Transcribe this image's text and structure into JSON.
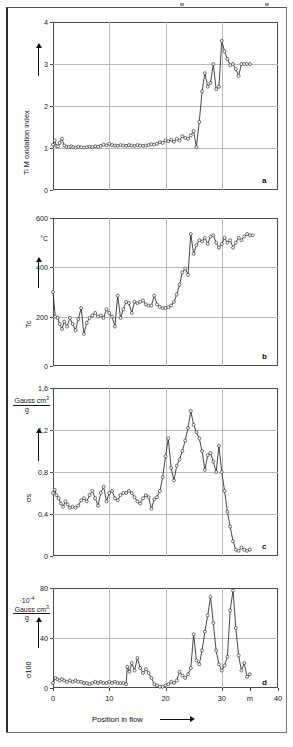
{
  "figure": {
    "panel_letters": [
      "a",
      "b",
      "c",
      "d"
    ],
    "x_axis": {
      "title": "Position in flow",
      "arrow": "⟶",
      "ticks": [
        "0",
        "10",
        "20",
        "30",
        "m",
        "40"
      ],
      "tick_values": [
        0,
        10,
        20,
        30,
        35,
        40
      ],
      "unit": "m",
      "min": 0,
      "max": 40
    }
  },
  "chart_data": [
    {
      "type": "line",
      "panel": "a",
      "title": "",
      "ylabel": "Ti M oxidation index",
      "xlabel": "Position in flow",
      "yunit": "",
      "ylim": [
        0,
        4
      ],
      "xlim": [
        0,
        40
      ],
      "yticks": [
        0,
        1,
        2,
        3,
        4
      ],
      "ytick_labels": [
        "0",
        "1",
        "2",
        "3",
        "4"
      ],
      "grid": true,
      "markers": "open-circle",
      "x": [
        0.0,
        0.3,
        0.6,
        0.9,
        1.2,
        1.6,
        2.0,
        2.4,
        2.8,
        3.2,
        3.6,
        4.0,
        4.5,
        5.0,
        5.5,
        6.0,
        6.5,
        7.0,
        7.5,
        8.0,
        8.5,
        9.0,
        9.5,
        10.0,
        10.5,
        11.0,
        11.5,
        12.0,
        12.5,
        13.0,
        13.5,
        14.0,
        14.5,
        15.0,
        15.5,
        16.0,
        16.5,
        17.0,
        17.5,
        18.0,
        18.5,
        19.0,
        19.5,
        20.0,
        20.5,
        21.0,
        21.5,
        22.0,
        22.5,
        23.0,
        23.5,
        24.0,
        24.5,
        25.0,
        25.5,
        26.0,
        26.5,
        27.0,
        27.5,
        28.0,
        28.5,
        29.0,
        29.5,
        30.0,
        30.5,
        31.0,
        31.5,
        32.0,
        32.5,
        33.0,
        33.5,
        34.0,
        34.5,
        35.0
      ],
      "values": [
        1.08,
        1.18,
        1.05,
        1.04,
        1.12,
        1.22,
        1.06,
        1.03,
        1.02,
        1.04,
        1.02,
        1.01,
        1.03,
        1.02,
        1.01,
        1.02,
        1.03,
        1.02,
        1.04,
        1.03,
        1.05,
        1.08,
        1.06,
        1.1,
        1.07,
        1.06,
        1.05,
        1.07,
        1.06,
        1.05,
        1.07,
        1.06,
        1.05,
        1.07,
        1.06,
        1.05,
        1.06,
        1.07,
        1.09,
        1.08,
        1.1,
        1.14,
        1.12,
        1.18,
        1.16,
        1.2,
        1.15,
        1.22,
        1.18,
        1.28,
        1.24,
        1.22,
        1.3,
        1.4,
        1.02,
        1.62,
        2.35,
        2.78,
        2.46,
        2.55,
        3.0,
        2.4,
        2.46,
        3.55,
        3.3,
        3.12,
        2.97,
        3.0,
        2.88,
        2.72,
        3.0,
        3.0,
        3.0,
        3.0
      ]
    },
    {
      "type": "line",
      "panel": "b",
      "title": "",
      "ylabel": "Tc",
      "xlabel": "Position in flow",
      "yunit": "°C",
      "ylim": [
        0,
        600
      ],
      "xlim": [
        0,
        40
      ],
      "yticks": [
        0,
        200,
        400,
        600
      ],
      "ytick_labels": [
        "0",
        "200",
        "400",
        "600"
      ],
      "grid": true,
      "markers": "open-circle",
      "x": [
        0.0,
        0.4,
        0.8,
        1.2,
        1.6,
        2.0,
        2.5,
        3.0,
        3.5,
        4.0,
        4.5,
        5.0,
        5.5,
        6.0,
        6.5,
        7.0,
        7.5,
        8.0,
        8.5,
        9.0,
        9.5,
        10.0,
        10.5,
        11.0,
        11.5,
        12.0,
        12.5,
        13.0,
        13.5,
        14.0,
        14.5,
        15.0,
        15.5,
        16.0,
        16.5,
        17.0,
        17.5,
        18.0,
        18.5,
        19.0,
        19.5,
        20.0,
        20.5,
        21.0,
        21.5,
        22.0,
        22.5,
        23.0,
        23.5,
        24.0,
        24.5,
        25.0,
        25.5,
        26.0,
        26.5,
        27.0,
        27.5,
        28.0,
        28.5,
        29.0,
        29.5,
        30.0,
        30.5,
        31.0,
        31.5,
        32.0,
        32.5,
        33.0,
        33.5,
        34.0,
        34.5,
        35.0,
        35.5
      ],
      "values": [
        300,
        200,
        195,
        170,
        150,
        180,
        160,
        195,
        170,
        145,
        190,
        235,
        130,
        175,
        195,
        205,
        215,
        200,
        205,
        195,
        230,
        215,
        200,
        160,
        285,
        195,
        230,
        260,
        255,
        215,
        260,
        255,
        260,
        265,
        250,
        245,
        245,
        285,
        250,
        240,
        235,
        235,
        238,
        245,
        260,
        290,
        330,
        380,
        395,
        370,
        535,
        455,
        490,
        510,
        505,
        520,
        495,
        525,
        530,
        500,
        480,
        495,
        520,
        500,
        510,
        480,
        500,
        520,
        510,
        525,
        535,
        530,
        530
      ]
    },
    {
      "type": "line",
      "panel": "c",
      "title": "",
      "ylabel": "σs",
      "xlabel": "Position in flow",
      "yunit": "Gauss cm3 / g",
      "yunit_numerator": "Gauss cm",
      "yunit_exponent": "3",
      "yunit_denominator": "g",
      "ylim": [
        0,
        1.6
      ],
      "xlim": [
        0,
        40
      ],
      "yticks": [
        0,
        0.4,
        0.8,
        1.2,
        1.6
      ],
      "ytick_labels": [
        "0",
        "0,4",
        "0,8",
        "1,2",
        "1,6"
      ],
      "grid": true,
      "markers": "open-circle",
      "x": [
        0.0,
        0.3,
        0.6,
        1.0,
        1.4,
        1.8,
        2.2,
        2.6,
        3.0,
        3.5,
        4.0,
        4.5,
        5.0,
        5.5,
        6.0,
        6.5,
        7.0,
        7.5,
        8.0,
        8.5,
        9.0,
        9.5,
        10.0,
        10.5,
        11.0,
        11.5,
        12.0,
        12.5,
        13.0,
        13.5,
        14.0,
        14.5,
        15.0,
        15.5,
        16.0,
        16.5,
        17.0,
        17.5,
        18.0,
        18.5,
        19.0,
        19.5,
        20.0,
        20.5,
        21.0,
        21.5,
        22.0,
        22.5,
        23.0,
        23.5,
        24.0,
        24.5,
        25.0,
        25.5,
        26.0,
        26.5,
        27.0,
        27.5,
        28.0,
        28.5,
        29.0,
        29.5,
        30.0,
        30.5,
        31.0,
        31.5,
        32.0,
        32.5,
        33.0,
        33.5,
        34.0,
        34.5,
        35.0
      ],
      "values": [
        0.6,
        0.63,
        0.58,
        0.55,
        0.5,
        0.47,
        0.52,
        0.49,
        0.46,
        0.47,
        0.46,
        0.48,
        0.53,
        0.55,
        0.52,
        0.58,
        0.62,
        0.55,
        0.48,
        0.6,
        0.66,
        0.52,
        0.6,
        0.62,
        0.55,
        0.53,
        0.58,
        0.6,
        0.6,
        0.62,
        0.6,
        0.56,
        0.52,
        0.5,
        0.55,
        0.58,
        0.56,
        0.45,
        0.54,
        0.56,
        0.62,
        0.75,
        0.95,
        1.12,
        0.84,
        0.72,
        0.86,
        0.92,
        1.0,
        1.1,
        1.22,
        1.38,
        1.25,
        1.18,
        1.12,
        1.0,
        0.82,
        0.96,
        0.98,
        0.9,
        0.8,
        1.05,
        0.8,
        0.62,
        0.42,
        0.28,
        0.14,
        0.06,
        0.05,
        0.08,
        0.06,
        0.05,
        0.06
      ]
    },
    {
      "type": "line",
      "panel": "d",
      "title": "",
      "ylabel": "σ100",
      "xlabel": "Position in flow",
      "yunit": "·10-4 Gauss cm3 / g",
      "yunit_prefix": "·10",
      "yunit_prefix_exp": "-4",
      "yunit_numerator": "Gauss cm",
      "yunit_exponent": "3",
      "yunit_denominator": "g",
      "ylim": [
        0,
        80
      ],
      "xlim": [
        0,
        40
      ],
      "yticks": [
        0,
        40,
        80
      ],
      "ytick_labels": [
        "0",
        "40",
        "80"
      ],
      "grid": true,
      "markers": "open-circle",
      "x": [
        0.0,
        0.4,
        0.8,
        1.2,
        1.6,
        2.0,
        2.5,
        3.0,
        3.5,
        4.0,
        4.5,
        5.0,
        5.5,
        6.0,
        6.5,
        7.0,
        7.5,
        8.0,
        8.5,
        9.0,
        9.5,
        10.0,
        10.5,
        11.0,
        11.5,
        12.0,
        12.5,
        13.0,
        13.2,
        13.6,
        14.0,
        14.5,
        15.0,
        15.5,
        16.0,
        16.5,
        17.0,
        17.5,
        18.0,
        18.5,
        19.0,
        19.5,
        20.0,
        20.5,
        21.0,
        21.5,
        22.0,
        22.5,
        23.0,
        23.5,
        24.0,
        24.5,
        25.0,
        25.5,
        26.0,
        26.5,
        27.0,
        27.5,
        28.0,
        28.5,
        29.0,
        29.5,
        30.0,
        30.5,
        31.0,
        31.5,
        32.0,
        32.5,
        33.0,
        33.5,
        34.0,
        34.5,
        35.0
      ],
      "values": [
        4,
        8,
        7,
        6,
        7,
        6,
        5,
        6,
        5,
        6,
        5,
        5,
        4,
        4,
        3,
        4,
        5,
        4,
        5,
        4,
        4,
        5,
        4,
        5,
        4,
        4,
        4,
        3,
        17,
        13,
        20,
        14,
        24,
        16,
        12,
        15,
        12,
        8,
        3,
        2,
        1,
        1,
        2,
        3,
        5,
        4,
        6,
        13,
        10,
        8,
        11,
        16,
        43,
        22,
        19,
        30,
        45,
        58,
        73,
        52,
        30,
        19,
        14,
        18,
        25,
        62,
        78,
        48,
        26,
        14,
        20,
        9,
        11
      ]
    }
  ]
}
